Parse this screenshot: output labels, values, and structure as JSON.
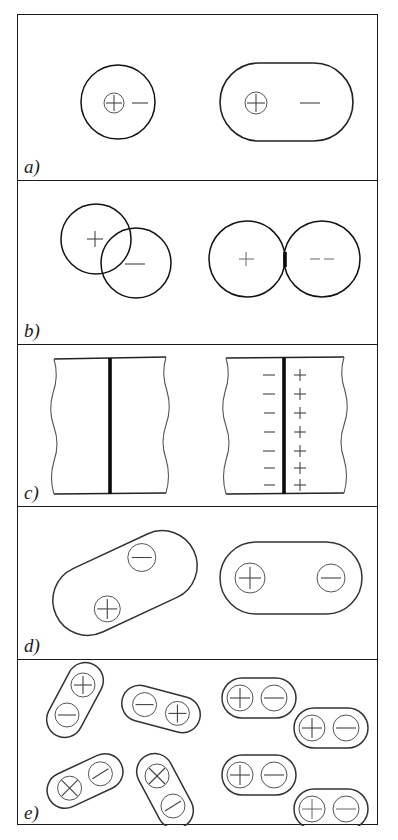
{
  "figure": {
    "panel_count": 5,
    "frame_color": "#1b1b1b",
    "background": "#ffffff"
  },
  "panels": [
    {
      "id": "a",
      "label": "a)",
      "caption": "electronic polarization",
      "left_state": "unpolarized",
      "right_state": "polarized",
      "left": {
        "shape": "circle",
        "charges": [
          {
            "symbol": "+",
            "type": "circled-plus",
            "name": "nucleus-positive"
          },
          {
            "symbol": "−",
            "type": "minus-sign",
            "name": "electron-cloud-negative"
          }
        ]
      },
      "right": {
        "shape": "stadium",
        "charges": [
          {
            "symbol": "+",
            "type": "circled-plus",
            "name": "nucleus-positive"
          },
          {
            "symbol": "−",
            "type": "minus-sign",
            "name": "electron-cloud-negative"
          }
        ]
      }
    },
    {
      "id": "b",
      "label": "b)",
      "caption": "ionic polarization",
      "left_state": "unpolarized",
      "right_state": "polarized",
      "left": {
        "shape": "two-overlapping-circles",
        "charges": [
          {
            "symbol": "+",
            "type": "plus-sign",
            "name": "cation-positive"
          },
          {
            "symbol": "−",
            "type": "minus-sign",
            "name": "anion-negative"
          }
        ]
      },
      "right": {
        "shape": "two-tangent-circles",
        "charges": [
          {
            "symbol": "+",
            "type": "plus-sign",
            "name": "cation-positive"
          },
          {
            "symbol": "−",
            "type": "minus-sign",
            "name": "anion-negative"
          }
        ]
      }
    },
    {
      "id": "c",
      "label": "c)",
      "caption": "interfacial / space-charge polarization",
      "left_state": "unpolarized",
      "right_state": "polarized",
      "left": {
        "shape": "rectangle-with-center-boundary",
        "charge_pairs": 0
      },
      "right": {
        "shape": "rectangle-with-center-boundary",
        "charge_pairs": 7,
        "left_column_symbol": "−",
        "right_column_symbol": "+"
      }
    },
    {
      "id": "d",
      "label": "d)",
      "caption": "orientational polarization of a single dipole",
      "left_state": "unpolarized",
      "right_state": "polarized",
      "left": {
        "shape": "tilted-stadium",
        "rotation_deg": -25,
        "charges": [
          {
            "symbol": "+",
            "type": "circled-plus",
            "name": "dipole-positive-end"
          },
          {
            "symbol": "−",
            "type": "circled-minus",
            "name": "dipole-negative-end"
          }
        ]
      },
      "right": {
        "shape": "stadium",
        "rotation_deg": 0,
        "charges": [
          {
            "symbol": "+",
            "type": "circled-plus",
            "name": "dipole-positive-end"
          },
          {
            "symbol": "−",
            "type": "circled-minus",
            "name": "dipole-negative-end"
          }
        ]
      }
    },
    {
      "id": "e",
      "label": "e)",
      "caption": "orientational polarization of many dipoles",
      "left_state": "randomly-oriented",
      "right_state": "aligned",
      "left": {
        "dipole_count": 4,
        "rotations_deg": [
          -62,
          25,
          -55,
          62
        ],
        "charges": [
          {
            "symbol": "−",
            "type": "circled-minus"
          },
          {
            "symbol": "+",
            "type": "circled-plus"
          }
        ]
      },
      "right": {
        "dipole_count": 4,
        "rotations_deg": [
          0,
          0,
          0,
          0
        ],
        "charges": [
          {
            "symbol": "+",
            "type": "circled-plus"
          },
          {
            "symbol": "−",
            "type": "circled-minus"
          }
        ]
      }
    }
  ]
}
